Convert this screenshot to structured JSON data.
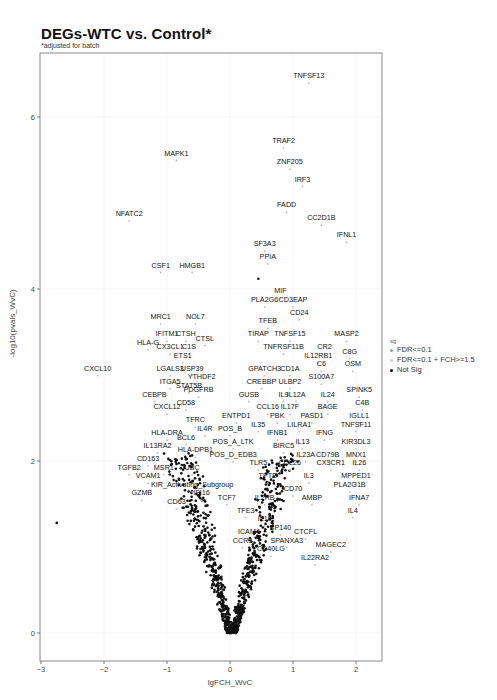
{
  "header": {
    "title": "DEGs-WTC vs. Control*",
    "subtitle": "*adjusted for batch"
  },
  "legend": {
    "title": "sig",
    "items": [
      {
        "label": "FDR<=0.1",
        "color": "#9a9a9a"
      },
      {
        "label": "FDR<=0.1 + FCH>=1.5",
        "color": "#cfcfcf"
      },
      {
        "label": "Not Sig",
        "color": "#111111"
      }
    ]
  },
  "colors": {
    "points": "#111111",
    "frame": "#8a8a8a",
    "grid": "#f0f0f0",
    "label_lines": "#333333"
  },
  "chart_data": {
    "type": "scatter",
    "title": "DEGs-WTC vs. Control*",
    "subtitle": "*adjusted for batch",
    "xlabel": "lgFCH_WvC",
    "ylabel": "-log10(pvals_WvC)",
    "xlim": [
      -3,
      2.4
    ],
    "ylim": [
      -0.3,
      6.7
    ],
    "xticks": [
      -3,
      -2,
      -1,
      0,
      1,
      2
    ],
    "yticks": [
      0,
      2,
      4,
      6
    ],
    "grid": true,
    "legend_position": "right",
    "labeled_points": [
      {
        "gene": "TNFSF13",
        "x": 1.25,
        "y": 6.45
      },
      {
        "gene": "TRAF2",
        "x": 0.85,
        "y": 5.7
      },
      {
        "gene": "MAPK1",
        "x": -0.85,
        "y": 5.55
      },
      {
        "gene": "ZNF205",
        "x": 0.95,
        "y": 5.45
      },
      {
        "gene": "IRF3",
        "x": 1.15,
        "y": 5.25
      },
      {
        "gene": "FADD",
        "x": 0.9,
        "y": 4.95
      },
      {
        "gene": "NFATC2",
        "x": -1.6,
        "y": 4.85
      },
      {
        "gene": "CC2D1B",
        "x": 1.45,
        "y": 4.8
      },
      {
        "gene": "IFNL1",
        "x": 1.85,
        "y": 4.6
      },
      {
        "gene": "SF3A3",
        "x": 0.55,
        "y": 4.5
      },
      {
        "gene": "PPIA",
        "x": 0.6,
        "y": 4.35
      },
      {
        "gene": "CSF1",
        "x": -1.1,
        "y": 4.25
      },
      {
        "gene": "HMGB1",
        "x": -0.6,
        "y": 4.25
      },
      {
        "gene": "MIF",
        "x": 0.8,
        "y": 3.95
      },
      {
        "gene": "PLA2G6",
        "x": 0.55,
        "y": 3.85
      },
      {
        "gene": "CD3EAP",
        "x": 1.0,
        "y": 3.85
      },
      {
        "gene": "CD24",
        "x": 1.1,
        "y": 3.7
      },
      {
        "gene": "MRC1",
        "x": -1.1,
        "y": 3.65
      },
      {
        "gene": "NOL7",
        "x": -0.55,
        "y": 3.65
      },
      {
        "gene": "TFEB",
        "x": 0.6,
        "y": 3.6
      },
      {
        "gene": "TIRAP",
        "x": 0.45,
        "y": 3.45
      },
      {
        "gene": "TNFSF15",
        "x": 0.95,
        "y": 3.45
      },
      {
        "gene": "MASP2",
        "x": 1.85,
        "y": 3.45
      },
      {
        "gene": "IFITM1",
        "x": -1.0,
        "y": 3.45
      },
      {
        "gene": "CTSH",
        "x": -0.7,
        "y": 3.45
      },
      {
        "gene": "CTSL",
        "x": -0.4,
        "y": 3.4
      },
      {
        "gene": "HLA-G",
        "x": -1.3,
        "y": 3.35
      },
      {
        "gene": "CX3CL1",
        "x": -0.95,
        "y": 3.3
      },
      {
        "gene": "C1S",
        "x": -0.65,
        "y": 3.3
      },
      {
        "gene": "CR2",
        "x": 1.5,
        "y": 3.3
      },
      {
        "gene": "TNFRSF11B",
        "x": 0.85,
        "y": 3.3
      },
      {
        "gene": "C8G",
        "x": 1.9,
        "y": 3.25
      },
      {
        "gene": "IL12RB1",
        "x": 1.4,
        "y": 3.2
      },
      {
        "gene": "ETS1",
        "x": -0.75,
        "y": 3.2
      },
      {
        "gene": "CXCL10",
        "x": -2.1,
        "y": 3.05
      },
      {
        "gene": "LGALS3",
        "x": -0.95,
        "y": 3.05
      },
      {
        "gene": "USP39",
        "x": -0.6,
        "y": 3.05
      },
      {
        "gene": "OSM",
        "x": 1.95,
        "y": 3.1
      },
      {
        "gene": "C6",
        "x": 1.45,
        "y": 3.1
      },
      {
        "gene": "GPATCH3",
        "x": 0.55,
        "y": 3.05
      },
      {
        "gene": "CD1A",
        "x": 0.95,
        "y": 3.05
      },
      {
        "gene": "S100A7",
        "x": 1.45,
        "y": 2.95
      },
      {
        "gene": "ITGA5",
        "x": -0.95,
        "y": 2.9
      },
      {
        "gene": "YTHDF2",
        "x": -0.45,
        "y": 2.95
      },
      {
        "gene": "CREBBP",
        "x": 0.5,
        "y": 2.9
      },
      {
        "gene": "ULBP2",
        "x": 0.95,
        "y": 2.9
      },
      {
        "gene": "STAT5B",
        "x": -0.65,
        "y": 2.85
      },
      {
        "gene": "PDGFRB",
        "x": -0.5,
        "y": 2.8
      },
      {
        "gene": "CEBPB",
        "x": -1.2,
        "y": 2.75
      },
      {
        "gene": "SPINK5",
        "x": 2.05,
        "y": 2.8
      },
      {
        "gene": "IL24",
        "x": 1.55,
        "y": 2.75
      },
      {
        "gene": "IL9",
        "x": 0.85,
        "y": 2.75
      },
      {
        "gene": "IL12A",
        "x": 1.05,
        "y": 2.75
      },
      {
        "gene": "GUSB",
        "x": 0.3,
        "y": 2.75
      },
      {
        "gene": "C4B",
        "x": 2.1,
        "y": 2.65
      },
      {
        "gene": "CD58",
        "x": -0.7,
        "y": 2.65
      },
      {
        "gene": "CXCL12",
        "x": -1.0,
        "y": 2.6
      },
      {
        "gene": "BAGE",
        "x": 1.55,
        "y": 2.6
      },
      {
        "gene": "CCL16",
        "x": 0.6,
        "y": 2.6
      },
      {
        "gene": "IL17F",
        "x": 0.95,
        "y": 2.6
      },
      {
        "gene": "ENTPD1",
        "x": 0.1,
        "y": 2.5
      },
      {
        "gene": "PBK",
        "x": 0.75,
        "y": 2.5
      },
      {
        "gene": "PASD1",
        "x": 1.3,
        "y": 2.5
      },
      {
        "gene": "IGLL1",
        "x": 2.05,
        "y": 2.5
      },
      {
        "gene": "TFRC",
        "x": -0.55,
        "y": 2.45
      },
      {
        "gene": "IL35",
        "x": 0.45,
        "y": 2.4
      },
      {
        "gene": "LILRA1",
        "x": 1.1,
        "y": 2.4
      },
      {
        "gene": "TNFSF11",
        "x": 2.0,
        "y": 2.4
      },
      {
        "gene": "POS_B",
        "x": 0.0,
        "y": 2.35
      },
      {
        "gene": "IL4R",
        "x": -0.4,
        "y": 2.35
      },
      {
        "gene": "IFNB1",
        "x": 0.75,
        "y": 2.3
      },
      {
        "gene": "IFNG",
        "x": 1.5,
        "y": 2.3
      },
      {
        "gene": "HLA-DRA",
        "x": -1.0,
        "y": 2.3
      },
      {
        "gene": "BCL6",
        "x": -0.7,
        "y": 2.25
      },
      {
        "gene": "POS_A_LTK",
        "x": 0.05,
        "y": 2.2
      },
      {
        "gene": "IL13",
        "x": 1.15,
        "y": 2.2
      },
      {
        "gene": "KIR3DL3",
        "x": 2.0,
        "y": 2.2
      },
      {
        "gene": "BIRC5",
        "x": 0.85,
        "y": 2.15
      },
      {
        "gene": "IL13RA2",
        "x": -1.15,
        "y": 2.15
      },
      {
        "gene": "HLA-DPB1",
        "x": -0.55,
        "y": 2.1
      },
      {
        "gene": "POS_D_EDB3",
        "x": 0.05,
        "y": 2.05
      },
      {
        "gene": "IL23A",
        "x": 1.2,
        "y": 2.05
      },
      {
        "gene": "CD79B",
        "x": 1.55,
        "y": 2.05
      },
      {
        "gene": "MNX1",
        "x": 2.0,
        "y": 2.05
      },
      {
        "gene": "CD163",
        "x": -1.3,
        "y": 2.0
      },
      {
        "gene": "TLR5",
        "x": 0.45,
        "y": 1.95
      },
      {
        "gene": "CCL26",
        "x": 0.95,
        "y": 1.95
      },
      {
        "gene": "CX3CR1",
        "x": 1.6,
        "y": 1.95
      },
      {
        "gene": "IL26",
        "x": 2.05,
        "y": 1.95
      },
      {
        "gene": "TGFB2",
        "x": -1.6,
        "y": 1.9
      },
      {
        "gene": "MSR1",
        "x": -1.05,
        "y": 1.9
      },
      {
        "gene": "UBC",
        "x": -0.6,
        "y": 1.9
      },
      {
        "gene": "TPTE",
        "x": 0.6,
        "y": 1.8
      },
      {
        "gene": "IL3",
        "x": 1.25,
        "y": 1.8
      },
      {
        "gene": "MPPED1",
        "x": 2.0,
        "y": 1.8
      },
      {
        "gene": "VCAM1",
        "x": -1.3,
        "y": 1.8
      },
      {
        "gene": "PLA2G1B",
        "x": 1.9,
        "y": 1.7
      },
      {
        "gene": "KIR_Activating_Subgroup",
        "x": -0.6,
        "y": 1.7
      },
      {
        "gene": "CD70",
        "x": 1.0,
        "y": 1.65
      },
      {
        "gene": "AMBP",
        "x": 1.3,
        "y": 1.55
      },
      {
        "gene": "IFI16",
        "x": -0.45,
        "y": 1.6
      },
      {
        "gene": "GZMB",
        "x": -1.4,
        "y": 1.6
      },
      {
        "gene": "TCF7",
        "x": -0.05,
        "y": 1.55
      },
      {
        "gene": "IL2RB",
        "x": 0.55,
        "y": 1.55
      },
      {
        "gene": "IFNA7",
        "x": 2.05,
        "y": 1.55
      },
      {
        "gene": "CD63",
        "x": -0.85,
        "y": 1.5
      },
      {
        "gene": "IL4",
        "x": 1.95,
        "y": 1.4
      },
      {
        "gene": "TFE3",
        "x": 0.25,
        "y": 1.4
      },
      {
        "gene": "IL19",
        "x": 0.55,
        "y": 1.3
      },
      {
        "gene": "ICAM4",
        "x": 0.3,
        "y": 1.15
      },
      {
        "gene": "SP140",
        "x": 0.8,
        "y": 1.2
      },
      {
        "gene": "CTCFL",
        "x": 1.2,
        "y": 1.15
      },
      {
        "gene": "CCR9",
        "x": 0.2,
        "y": 1.05
      },
      {
        "gene": "SPANXA3",
        "x": 0.9,
        "y": 1.05
      },
      {
        "gene": "MAGEC2",
        "x": 1.6,
        "y": 1.0
      },
      {
        "gene": "CD40LG",
        "x": 0.65,
        "y": 0.95
      },
      {
        "gene": "IL22RA2",
        "x": 1.35,
        "y": 0.85
      }
    ],
    "outlier_points": [
      {
        "x": -2.75,
        "y": 1.28
      },
      {
        "x": 0.45,
        "y": 4.12
      }
    ],
    "note": "~1000 unlabeled Not-Sig points form a V-shaped volcano cloud centered near x=0, y=0, spreading to |x|~1 at y~2"
  }
}
